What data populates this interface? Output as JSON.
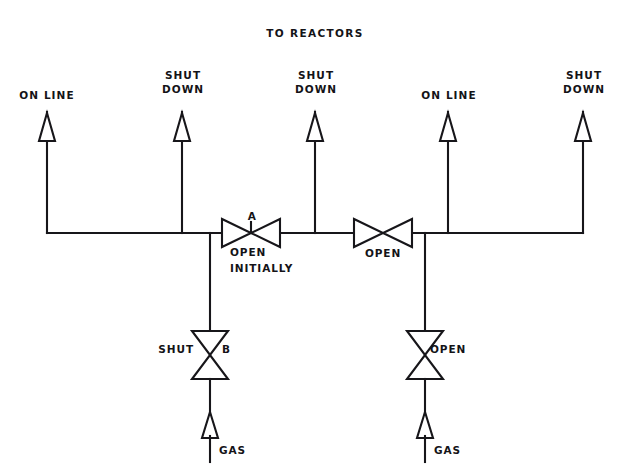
{
  "diagram": {
    "title": "TO REACTORS",
    "type": "piping-and-instrumentation-diagram",
    "colors": {
      "line": "#17161a",
      "background": "#ffffff",
      "text": "#141317"
    },
    "header_pipe": {
      "name": "gas header",
      "y": 233,
      "x_start": 47,
      "x_end": 583
    },
    "risers": [
      {
        "id": "riser-1",
        "x": 47,
        "label": "ON LINE",
        "label_lines": [
          "ON LINE"
        ],
        "arrow": "up",
        "top_y": 110
      },
      {
        "id": "riser-2",
        "x": 182,
        "label": "SHUT DOWN",
        "label_lines": [
          "SHUT",
          "DOWN"
        ],
        "arrow": "up",
        "top_y": 110
      },
      {
        "id": "riser-3",
        "x": 315,
        "label": "SHUT DOWN",
        "label_lines": [
          "SHUT",
          "DOWN"
        ],
        "arrow": "up",
        "top_y": 110
      },
      {
        "id": "riser-4",
        "x": 448,
        "label": "ON LINE",
        "label_lines": [
          "ON LINE"
        ],
        "arrow": "up",
        "top_y": 110
      },
      {
        "id": "riser-5",
        "x": 583,
        "label": "SHUT DOWN",
        "label_lines": [
          "SHUT",
          "DOWN"
        ],
        "arrow": "up",
        "top_y": 110
      }
    ],
    "header_valves": [
      {
        "id": "valve-a",
        "orientation": "horizontal",
        "cx": 251,
        "cy": 233,
        "letter": "A",
        "status_lines": [
          "OPEN",
          "INITIALLY"
        ],
        "status": "OPEN INITIALLY"
      },
      {
        "id": "valve-header-2",
        "orientation": "horizontal",
        "cx": 383,
        "cy": 233,
        "letter": "",
        "status_lines": [
          "OPEN"
        ],
        "status": "OPEN"
      }
    ],
    "branches": [
      {
        "id": "branch-left",
        "x": 210,
        "drop_from_y": 233,
        "valve": {
          "id": "valve-b",
          "orientation": "vertical",
          "cy": 355,
          "letter": "B",
          "letter_side": "right",
          "status": "SHUT",
          "status_side": "left"
        },
        "inlet": {
          "label": "GAS",
          "arrow": "up",
          "y": 430
        }
      },
      {
        "id": "branch-right",
        "x": 425,
        "drop_from_y": 233,
        "valve": {
          "id": "valve-right",
          "orientation": "vertical",
          "cy": 355,
          "letter": "",
          "letter_side": "right",
          "status": "OPEN",
          "status_side": "right"
        },
        "inlet": {
          "label": "GAS",
          "arrow": "up",
          "y": 430
        }
      }
    ]
  }
}
